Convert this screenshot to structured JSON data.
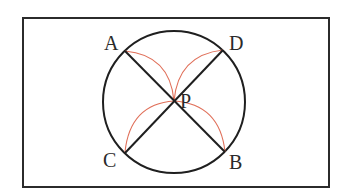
{
  "diagram": {
    "frame": {
      "x": 23,
      "y": 18,
      "width": 306,
      "height": 169,
      "stroke": "#2b2b2b"
    },
    "circle": {
      "cx": 174,
      "cy": 102,
      "r": 71,
      "stroke": "#1f1f1f"
    },
    "points": {
      "A": {
        "label": "A",
        "x": 125,
        "y": 51
      },
      "D": {
        "label": "D",
        "x": 223,
        "y": 50
      },
      "C": {
        "label": "C",
        "x": 125,
        "y": 153
      },
      "B": {
        "label": "B",
        "x": 225,
        "y": 152
      },
      "P": {
        "label": "P",
        "x": 174,
        "y": 101
      }
    },
    "arc_color": "#e0705a",
    "line_color": "#1f1f1f"
  }
}
